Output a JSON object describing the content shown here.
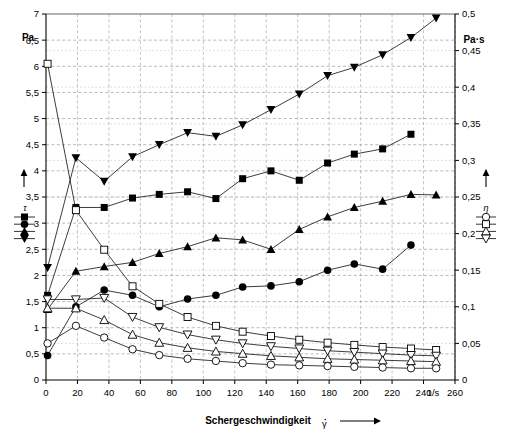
{
  "figure": {
    "left_axis_unit": "Pa",
    "right_axis_unit": "Pa·s",
    "x_axis_title": "Schergeschwindigkeit",
    "x_axis_title_symbol": "γ",
    "x_axis_unit": "1/s",
    "left_legend_symbol": "τ",
    "right_legend_symbol": "η"
  },
  "chart_data": {
    "type": "line",
    "title": "",
    "xlabel": "Schergeschwindigkeit γ",
    "ylabel": "τ (Pa)",
    "ylabel_right": "η (Pa·s)",
    "xlim": [
      0,
      260
    ],
    "ylim": [
      0,
      7
    ],
    "ylim_right": [
      0,
      0.5
    ],
    "grid": true,
    "legend_position": "outside-left-and-right",
    "x_ticks": [
      0,
      20,
      40,
      60,
      80,
      100,
      120,
      140,
      160,
      180,
      200,
      220,
      240,
      260
    ],
    "y_ticks_left": [
      0,
      0.5,
      1,
      1.5,
      2,
      2.5,
      3,
      3.5,
      4,
      4.5,
      5,
      5.5,
      6,
      6.5,
      7
    ],
    "y_ticks_right": [
      0,
      0.05,
      0.1,
      0.15,
      0.2,
      0.25,
      0.3,
      0.35,
      0.4,
      0.45,
      0.5
    ],
    "y_tick_labels_left": [
      "0",
      "0,5",
      "1",
      "1,5",
      "2",
      "2,5",
      "3",
      "3,5",
      "4",
      "4,5",
      "5",
      "5,5",
      "6",
      "6,5",
      "7"
    ],
    "y_tick_labels_right": [
      "0",
      "0,05",
      "0,1",
      "0,15",
      "0,2",
      "0,25",
      "0,3",
      "0,35",
      "0,4",
      "0,45",
      "0,5"
    ],
    "series": [
      {
        "name": "tau-down-triangle",
        "symbol": "▼",
        "marker": "triangle-down-filled",
        "axis": "left",
        "legend_group": "τ",
        "x": [
          1,
          19,
          37,
          55,
          72,
          90,
          108,
          125,
          143,
          161,
          179,
          196,
          214,
          232,
          248
        ],
        "y": [
          2.15,
          4.25,
          3.8,
          4.27,
          4.5,
          4.73,
          4.66,
          4.88,
          5.17,
          5.47,
          5.82,
          5.98,
          6.22,
          6.55,
          6.92
        ]
      },
      {
        "name": "tau-square",
        "symbol": "■",
        "marker": "square-filled",
        "axis": "left",
        "legend_group": "τ",
        "x": [
          1,
          19,
          37,
          55,
          72,
          90,
          108,
          125,
          143,
          161,
          179,
          196,
          214,
          232
        ],
        "y": [
          1.62,
          3.3,
          3.3,
          3.48,
          3.55,
          3.6,
          3.47,
          3.85,
          4.0,
          3.82,
          4.15,
          4.32,
          4.42,
          4.7
        ]
      },
      {
        "name": "tau-up-triangle",
        "symbol": "▲",
        "marker": "triangle-up-filled",
        "axis": "left",
        "legend_group": "τ",
        "x": [
          1,
          19,
          37,
          55,
          72,
          90,
          108,
          125,
          143,
          161,
          179,
          196,
          214,
          232,
          248
        ],
        "y": [
          1.35,
          2.08,
          2.17,
          2.25,
          2.42,
          2.55,
          2.72,
          2.68,
          2.5,
          2.88,
          3.12,
          3.3,
          3.42,
          3.55,
          3.54
        ]
      },
      {
        "name": "tau-circle",
        "symbol": "●",
        "marker": "circle-filled",
        "axis": "left",
        "legend_group": "τ",
        "x": [
          1,
          19,
          37,
          55,
          72,
          90,
          108,
          125,
          143,
          161,
          179,
          196,
          214,
          232
        ],
        "y": [
          0.47,
          1.4,
          1.72,
          1.62,
          1.4,
          1.55,
          1.62,
          1.78,
          1.8,
          1.88,
          2.1,
          2.22,
          2.12,
          2.58
        ]
      },
      {
        "name": "eta-square",
        "symbol": "□",
        "marker": "square-open",
        "axis": "right",
        "legend_group": "η",
        "x": [
          1,
          19,
          37,
          55,
          72,
          90,
          108,
          125,
          143,
          161,
          179,
          196,
          214,
          232,
          248
        ],
        "y": [
          0.432,
          0.232,
          0.178,
          0.128,
          0.104,
          0.086,
          0.074,
          0.066,
          0.06,
          0.055,
          0.051,
          0.048,
          0.045,
          0.043,
          0.041
        ]
      },
      {
        "name": "eta-down-triangle",
        "symbol": "▽",
        "marker": "triangle-down-open",
        "axis": "right",
        "legend_group": "η",
        "x": [
          1,
          19,
          37,
          55,
          72,
          90,
          108,
          125,
          143,
          161,
          179,
          196,
          214,
          232,
          248
        ],
        "y": [
          0.11,
          0.11,
          0.112,
          0.086,
          0.072,
          0.062,
          0.055,
          0.05,
          0.046,
          0.043,
          0.04,
          0.038,
          0.036,
          0.034,
          0.033
        ]
      },
      {
        "name": "eta-up-triangle",
        "symbol": "△",
        "marker": "triangle-up-open",
        "axis": "right",
        "legend_group": "η",
        "x": [
          1,
          19,
          37,
          55,
          72,
          90,
          108,
          125,
          143,
          161,
          179,
          196,
          214,
          232,
          248
        ],
        "y": [
          0.098,
          0.098,
          0.082,
          0.062,
          0.051,
          0.044,
          0.039,
          0.036,
          0.033,
          0.031,
          0.029,
          0.028,
          0.027,
          0.026,
          0.025
        ]
      },
      {
        "name": "eta-circle",
        "symbol": "○",
        "marker": "circle-open",
        "axis": "right",
        "legend_group": "η",
        "x": [
          1,
          19,
          37,
          55,
          72,
          90,
          108,
          125,
          143,
          161,
          179,
          196,
          214,
          232,
          248
        ],
        "y": [
          0.05,
          0.074,
          0.058,
          0.042,
          0.034,
          0.029,
          0.026,
          0.023,
          0.021,
          0.02,
          0.019,
          0.018,
          0.017,
          0.016,
          0.016
        ]
      }
    ],
    "left_legend_markers": [
      "square-filled",
      "circle-filled",
      "triangle-up-filled",
      "triangle-down-filled"
    ],
    "right_legend_markers": [
      "circle-open",
      "square-open",
      "triangle-up-open",
      "triangle-down-open"
    ]
  }
}
